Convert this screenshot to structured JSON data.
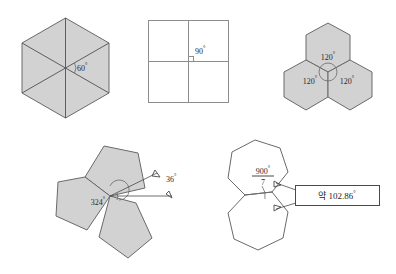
{
  "sheet": {
    "title": "Regular polygon tessellation angle figures",
    "background_color": "#ffffff",
    "fill_color": "#d2d2d2",
    "stroke_color": "#6a6a6a"
  },
  "figures": [
    {
      "id": "hexagon-six-triangles",
      "name": "Regular hexagon divided into six triangles",
      "shape": "hexagon",
      "filled": true,
      "labels": [
        {
          "text": "60",
          "degree": "°"
        }
      ]
    },
    {
      "id": "four-squares",
      "name": "Four squares meeting at a point",
      "shape": "square-grid",
      "filled": false,
      "labels": [
        {
          "text": "90",
          "degree": "°"
        }
      ]
    },
    {
      "id": "three-hexagons",
      "name": "Three regular hexagons meeting at a vertex",
      "shape": "hexagon",
      "filled": true,
      "labels": [
        {
          "text": "120",
          "degree": "°"
        },
        {
          "text": "120",
          "degree": "°"
        },
        {
          "text": "120",
          "degree": "°"
        }
      ]
    },
    {
      "id": "three-pentagons",
      "name": "Three regular pentagons leaving a gap",
      "shape": "pentagon",
      "filled": true,
      "labels": [
        {
          "text": "324",
          "degree": "°"
        },
        {
          "text": "36",
          "degree": "°"
        }
      ]
    },
    {
      "id": "two-heptagons",
      "name": "Two regular heptagons sharing an edge",
      "shape": "heptagon",
      "filled": false,
      "labels": [
        {
          "numerator": "900",
          "numerator_degree": "°",
          "denominator": "7"
        },
        {
          "text": "약 102.86",
          "degree": "°",
          "boxed": true
        }
      ]
    }
  ]
}
